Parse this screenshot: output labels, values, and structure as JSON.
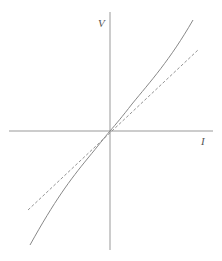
{
  "diagram": {
    "axes": {
      "x_label": "I",
      "y_label": "V"
    },
    "curves": [
      {
        "name": "nonlinear-characteristic",
        "style": "solid"
      },
      {
        "name": "linear-tangent",
        "style": "dashed"
      }
    ],
    "colors": {
      "axis": "#888888",
      "curve": "#777777",
      "dashed": "#888888"
    }
  }
}
